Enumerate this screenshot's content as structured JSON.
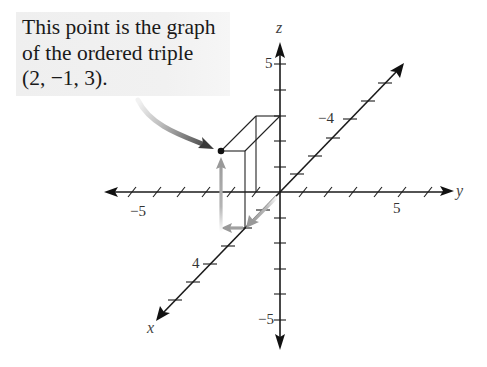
{
  "callout": {
    "lines": [
      "This point is the graph",
      "of the ordered triple",
      "(2, −1, 3)."
    ],
    "background": "#f0f0f0"
  },
  "point": {
    "x": 2,
    "y": -1,
    "z": 3,
    "label": "(2, −1, 3)"
  },
  "axes": {
    "x": {
      "name": "x",
      "tick_labels": [
        {
          "value": 4,
          "text": "4"
        },
        {
          "value": -4,
          "text": "−4"
        }
      ]
    },
    "y": {
      "name": "y",
      "tick_labels": [
        {
          "value": -5,
          "text": "−5"
        },
        {
          "value": 5,
          "text": "5"
        }
      ]
    },
    "z": {
      "name": "z",
      "tick_labels": [
        {
          "value": 5,
          "text": "5"
        },
        {
          "value": -5,
          "text": "−5"
        }
      ]
    }
  },
  "colors": {
    "axis": "#1a1a1a",
    "guide_arrow": "#9a9a9a",
    "callout_arrow_start": "#e0e0e0",
    "callout_arrow_end": "#444444",
    "point": "#111111"
  }
}
